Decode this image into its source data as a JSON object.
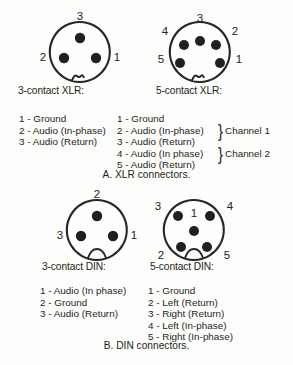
{
  "figure_a": {
    "caption": "A. XLR connectors.",
    "connectors": [
      {
        "name": "3-contact XLR",
        "label": "3-contact XLR:",
        "type": "xlr",
        "pins": [
          {
            "number": "3",
            "cx": 42,
            "cy": 26,
            "label_x": 42,
            "label_y": 5
          },
          {
            "number": "2",
            "cx": 26,
            "cy": 46,
            "label_x": 5,
            "label_y": 46
          },
          {
            "number": "1",
            "cx": 58,
            "cy": 46,
            "label_x": 79,
            "label_y": 46
          }
        ],
        "legend": [
          "1 - Ground",
          "2 - Audio (In-phase)",
          "3 - Audio (Return)"
        ]
      },
      {
        "name": "5-contact XLR",
        "label": "5-contact XLR:",
        "type": "xlr",
        "pins": [
          {
            "number": "3",
            "cx": 42,
            "cy": 29,
            "label_x": 42,
            "label_y": 7
          },
          {
            "number": "4",
            "cx": 26,
            "cy": 33,
            "label_x": 7,
            "label_y": 20
          },
          {
            "number": "2",
            "cx": 58,
            "cy": 33,
            "label_x": 77,
            "label_y": 20
          },
          {
            "number": "5",
            "cx": 22,
            "cy": 51,
            "label_x": 3,
            "label_y": 48
          },
          {
            "number": "1",
            "cx": 62,
            "cy": 51,
            "label_x": 81,
            "label_y": 48
          }
        ],
        "legend": [
          "1 - Ground",
          "2 - Audio (In-phase)",
          "3 - Audio (Return)",
          "4 - Audio (In phase)",
          "5 - Audio (Return)"
        ],
        "channel_braces": [
          {
            "label": "Channel 1",
            "brace": "}"
          },
          {
            "label": "Channel 2",
            "brace": "}"
          }
        ]
      }
    ]
  },
  "figure_b": {
    "caption": "B. DIN connectors.",
    "connectors": [
      {
        "name": "3-contact DIN",
        "label": "3-contact DIN:",
        "type": "din",
        "pins": [
          {
            "number": "2",
            "cx": 42,
            "cy": 26,
            "label_x": 42,
            "label_y": 5
          },
          {
            "number": "3",
            "cx": 26,
            "cy": 46,
            "label_x": 5,
            "label_y": 46
          },
          {
            "number": "1",
            "cx": 58,
            "cy": 46,
            "label_x": 79,
            "label_y": 46
          }
        ],
        "legend": [
          "1 - Audio (In phase)",
          "2 - Ground",
          "3 - Audio (Return)"
        ]
      },
      {
        "name": "5-contact DIN",
        "label": "5-contact DIN:",
        "type": "din",
        "pins": [
          {
            "number": "3",
            "cx": 26,
            "cy": 26,
            "label_x": 6,
            "label_y": 17
          },
          {
            "number": "4",
            "cx": 58,
            "cy": 26,
            "label_x": 78,
            "label_y": 17
          },
          {
            "number": "1",
            "cx": 42,
            "cy": 41,
            "label_x": 42,
            "label_y": 24
          },
          {
            "number": "2",
            "cx": 29,
            "cy": 57,
            "label_x": 9,
            "label_y": 66
          },
          {
            "number": "5",
            "cx": 55,
            "cy": 57,
            "label_x": 75,
            "label_y": 66
          }
        ],
        "legend": [
          "1 - Ground",
          "2 - Left (Return)",
          "3 - Right (Return)",
          "4 - Left (In-phase)",
          "5 - Right (In-phase)"
        ]
      }
    ]
  },
  "colors": {
    "background": "#fdfdfb",
    "ink": "#231f20",
    "pin_fill": "#241f1f",
    "shell_stroke": "#2a2626"
  }
}
